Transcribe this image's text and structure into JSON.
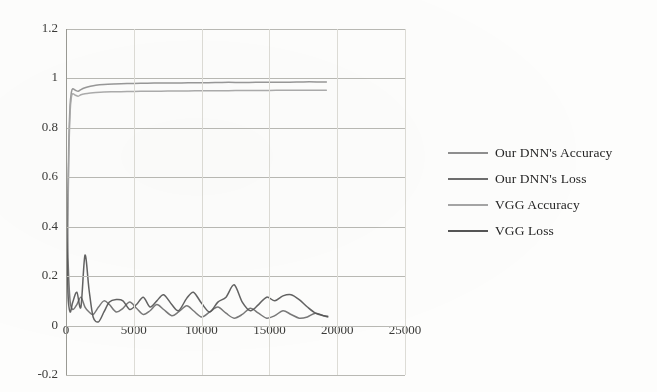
{
  "chart_data": {
    "type": "line",
    "title": "",
    "xlabel": "",
    "ylabel": "",
    "xlim": [
      0,
      25000
    ],
    "ylim": [
      -0.2,
      1.2
    ],
    "xticks": [
      "0",
      "5000",
      "10000",
      "15000",
      "20000",
      "25000"
    ],
    "xtick_values": [
      0,
      5000,
      10000,
      15000,
      20000,
      25000
    ],
    "yticks": [
      "1.2",
      "1",
      "0.8",
      "0.6",
      "0.4",
      "0.2",
      "0",
      "-0.2"
    ],
    "ytick_values": [
      1.2,
      1,
      0.8,
      0.6,
      0.4,
      0.2,
      0,
      -0.2
    ],
    "grid": "horizontal-major-and-faint-vertical",
    "legend_position": "right",
    "series": [
      {
        "name": "Our DNN's Accuracy",
        "color": "#8f8f8f",
        "x": [
          0,
          100,
          200,
          300,
          400,
          500,
          700,
          900,
          1100,
          1400,
          1800,
          2200,
          2800,
          3500,
          4500,
          5500,
          6500,
          7500,
          8500,
          9500,
          10500,
          11500,
          12500,
          13500,
          14500,
          15500,
          16500,
          17500,
          18500,
          19200
        ],
        "values": [
          0.02,
          0.33,
          0.72,
          0.89,
          0.945,
          0.958,
          0.952,
          0.948,
          0.955,
          0.962,
          0.968,
          0.972,
          0.975,
          0.977,
          0.979,
          0.98,
          0.981,
          0.982,
          0.982,
          0.983,
          0.983,
          0.984,
          0.984,
          0.984,
          0.985,
          0.985,
          0.985,
          0.986,
          0.986,
          0.986
        ]
      },
      {
        "name": "Our DNN's Loss",
        "color": "#6d6d6d",
        "x": [
          0,
          60,
          150,
          300,
          500,
          800,
          1100,
          1400,
          1700,
          2000,
          2400,
          2800,
          3200,
          3700,
          4200,
          4700,
          5200,
          5700,
          6200,
          6700,
          7200,
          7800,
          8300,
          8900,
          9400,
          10000,
          10600,
          11200,
          11800,
          12400,
          13000,
          13600,
          14200,
          14800,
          15400,
          16000,
          16600,
          17200,
          17800,
          18400,
          19000,
          19300
        ],
        "values": [
          0.73,
          0.52,
          0.27,
          0.1,
          0.065,
          0.085,
          0.115,
          0.075,
          0.055,
          0.045,
          0.075,
          0.1,
          0.085,
          0.055,
          0.07,
          0.095,
          0.07,
          0.045,
          0.06,
          0.085,
          0.065,
          0.04,
          0.055,
          0.08,
          0.06,
          0.035,
          0.055,
          0.075,
          0.05,
          0.03,
          0.045,
          0.07,
          0.05,
          0.03,
          0.04,
          0.06,
          0.045,
          0.03,
          0.035,
          0.05,
          0.04,
          0.035
        ]
      },
      {
        "name": "VGG Accuracy",
        "color": "#a5a5a5",
        "x": [
          0,
          100,
          200,
          300,
          400,
          500,
          700,
          900,
          1100,
          1400,
          1800,
          2200,
          2800,
          3500,
          4500,
          5500,
          6500,
          7500,
          8500,
          9500,
          10500,
          11500,
          12500,
          13500,
          14500,
          15500,
          16500,
          17500,
          18500,
          19200
        ],
        "values": [
          0.01,
          0.28,
          0.66,
          0.86,
          0.925,
          0.938,
          0.932,
          0.928,
          0.934,
          0.938,
          0.941,
          0.943,
          0.945,
          0.946,
          0.947,
          0.948,
          0.948,
          0.949,
          0.949,
          0.95,
          0.95,
          0.95,
          0.951,
          0.951,
          0.951,
          0.952,
          0.952,
          0.952,
          0.952,
          0.952
        ]
      },
      {
        "name": "VGG Loss",
        "color": "#555555",
        "x": [
          0,
          60,
          150,
          300,
          500,
          800,
          1100,
          1400,
          1700,
          2000,
          2400,
          2800,
          3200,
          3700,
          4200,
          4700,
          5200,
          5700,
          6200,
          6700,
          7200,
          7800,
          8300,
          8900,
          9400,
          10000,
          10600,
          11200,
          11800,
          12400,
          13000,
          13600,
          14200,
          14800,
          15400,
          16000,
          16600,
          17200,
          17800,
          18400,
          19000,
          19300
        ],
        "values": [
          0.7,
          0.4,
          0.13,
          0.055,
          0.095,
          0.135,
          0.075,
          0.285,
          0.145,
          0.035,
          0.015,
          0.055,
          0.095,
          0.105,
          0.1,
          0.065,
          0.085,
          0.115,
          0.075,
          0.1,
          0.125,
          0.085,
          0.06,
          0.11,
          0.135,
          0.09,
          0.055,
          0.095,
          0.115,
          0.165,
          0.095,
          0.06,
          0.085,
          0.115,
          0.1,
          0.12,
          0.125,
          0.105,
          0.075,
          0.05,
          0.04,
          0.038
        ]
      }
    ]
  },
  "legend": {
    "items": [
      {
        "label": "Our DNN's Accuracy",
        "color": "#8f8f8f"
      },
      {
        "label": "Our DNN's Loss",
        "color": "#6d6d6d"
      },
      {
        "label": "VGG Accuracy",
        "color": "#a5a5a5"
      },
      {
        "label": "VGG Loss",
        "color": "#555555"
      }
    ]
  },
  "axes": {
    "y_labels": [
      "1.2",
      "1",
      "0.8",
      "0.6",
      "0.4",
      "0.2",
      "0",
      "-0.2"
    ],
    "x_labels": [
      "0",
      "5000",
      "10000",
      "15000",
      "20000",
      "25000"
    ]
  },
  "colors": {
    "grid": "#b9b9b4",
    "grid_faint": "#dddcd6",
    "text": "#2b2b2b",
    "background": "#fdfdfc"
  }
}
